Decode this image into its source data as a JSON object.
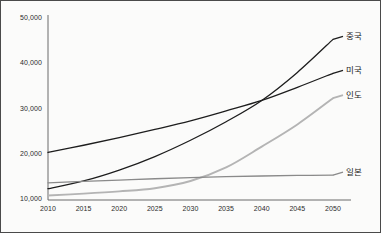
{
  "chart_data": {
    "type": "line",
    "title": "",
    "xlabel": "",
    "ylabel": "",
    "x": [
      2010,
      2015,
      2020,
      2025,
      2030,
      2035,
      2040,
      2045,
      2050
    ],
    "xlim": [
      2010,
      2050
    ],
    "ylim": [
      10000,
      50000
    ],
    "ytick_labels": [
      "10,000",
      "20,000",
      "30,000",
      "40,000",
      "50,000"
    ],
    "ytick_values": [
      10000,
      20000,
      30000,
      40000,
      50000
    ],
    "xtick_labels": [
      "2010",
      "2015",
      "2020",
      "2025",
      "2030",
      "2035",
      "2040",
      "2045",
      "2050"
    ],
    "grid": false,
    "legend_position": "right-inline-labels",
    "series": [
      {
        "name": "중국",
        "color": "#1d1d1d",
        "width": 1.3,
        "values": [
          12500,
          14200,
          16600,
          19600,
          23200,
          27300,
          32000,
          38200,
          45500
        ]
      },
      {
        "name": "미국",
        "color": "#1d1d1d",
        "width": 1.3,
        "values": [
          20500,
          22100,
          23800,
          25600,
          27500,
          29700,
          32000,
          34900,
          38000
        ]
      },
      {
        "name": "인도",
        "color": "#b4b4b4",
        "width": 1.9,
        "values": [
          11000,
          11400,
          11900,
          12600,
          14200,
          17200,
          21800,
          26700,
          32500
        ]
      },
      {
        "name": "일본",
        "color": "#8a8a8a",
        "width": 1.3,
        "values": [
          13800,
          14100,
          14400,
          14700,
          14950,
          15150,
          15300,
          15420,
          15500
        ]
      }
    ]
  },
  "axis": {
    "line_color": "#6b6b6b"
  }
}
